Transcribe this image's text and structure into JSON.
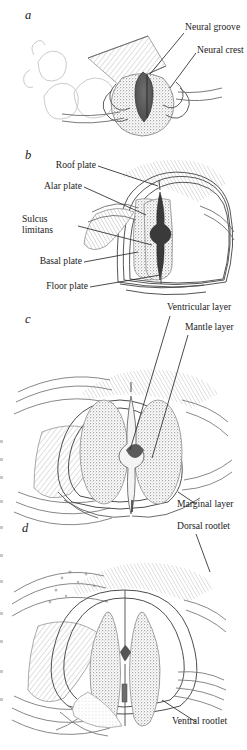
{
  "figure": {
    "type": "anatomical-illustration",
    "style": "grayscale stippled line drawing",
    "panel_count": 4
  },
  "panels": [
    {
      "id": "a",
      "letter": "a",
      "stage": "neural groove / neural crest stage",
      "labels": [
        {
          "key": "neural_groove",
          "text": "Neural groove"
        },
        {
          "key": "neural_crest",
          "text": "Neural crest"
        }
      ]
    },
    {
      "id": "b",
      "letter": "b",
      "stage": "closed neural tube with plates",
      "labels": [
        {
          "key": "roof_plate",
          "text": "Roof plate"
        },
        {
          "key": "alar_plate",
          "text": "Alar plate"
        },
        {
          "key": "sulcus_limitans",
          "text": "Sulcus limitans"
        },
        {
          "key": "basal_plate",
          "text": "Basal plate"
        },
        {
          "key": "floor_plate",
          "text": "Floor plate"
        }
      ]
    },
    {
      "id": "c",
      "letter": "c",
      "stage": "three-layered neural tube",
      "labels": [
        {
          "key": "ventricular_layer",
          "text": "Ventricular layer"
        },
        {
          "key": "mantle_layer",
          "text": "Mantle layer"
        },
        {
          "key": "marginal_layer",
          "text": "Marginal layer"
        }
      ]
    },
    {
      "id": "d",
      "letter": "d",
      "stage": "spinal cord with dorsal and ventral rootlets",
      "labels": [
        {
          "key": "dorsal_rootlet",
          "text": "Dorsal rootlet"
        },
        {
          "key": "ventral_rootlet",
          "text": "Ventral rootlet"
        }
      ]
    }
  ],
  "colors": {
    "background": "#ffffff",
    "ink": "#1b1b1b",
    "leader_line": "#2a2a2a",
    "stipple_gray": "#9a9a9a",
    "mantle_fill": "#b4b4b4",
    "crest_dark": "#5c5c5c",
    "canal_dark": "#3d3d3d",
    "light_tissue": "#d8d8d8"
  }
}
